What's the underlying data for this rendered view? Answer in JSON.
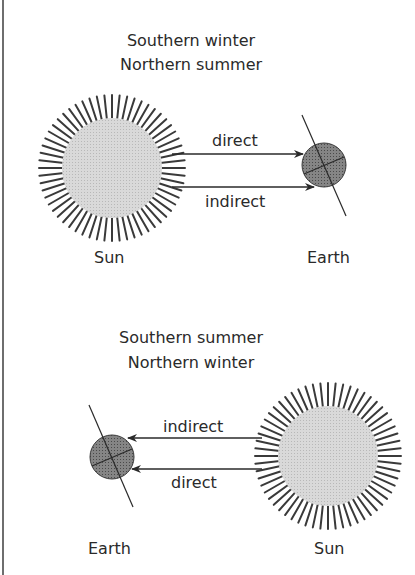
{
  "colors": {
    "sun_fill": "#d4d4d4",
    "ray_stroke": "#3a3a3a",
    "earth_fill": "#7a7a7a",
    "line": "#2a2a2a",
    "border": "#6e6e6e"
  },
  "panels": [
    {
      "title_line1": "Southern winter",
      "title_line2": "Northern summer",
      "sun_label": "Sun",
      "earth_label": "Earth",
      "arrows": [
        {
          "label": "direct",
          "from": "sun",
          "to": "earth"
        },
        {
          "label": "indirect",
          "from": "sun",
          "to": "earth"
        }
      ],
      "layout": "sun-left-earth-right"
    },
    {
      "title_line1": "Southern summer",
      "title_line2": "Northern winter",
      "sun_label": "Sun",
      "earth_label": "Earth",
      "arrows": [
        {
          "label": "indirect",
          "from": "sun",
          "to": "earth"
        },
        {
          "label": "direct",
          "from": "sun",
          "to": "earth"
        }
      ],
      "layout": "earth-left-sun-right"
    }
  ]
}
